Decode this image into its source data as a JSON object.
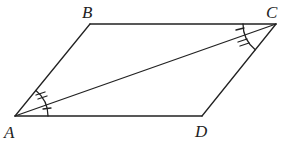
{
  "diagram": {
    "type": "parallelogram",
    "colors": {
      "stroke": "#222222",
      "background": "#ffffff"
    },
    "vertices": [
      {
        "name": "A",
        "x": 15,
        "y": 116
      },
      {
        "name": "B",
        "x": 90,
        "y": 24
      },
      {
        "name": "C",
        "x": 276,
        "y": 24
      },
      {
        "name": "D",
        "x": 202,
        "y": 116
      }
    ],
    "labels": {
      "A": "A",
      "B": "B",
      "C": "C",
      "D": "D"
    },
    "segments": [
      "AB",
      "BC",
      "CD",
      "DA",
      "AC"
    ],
    "angle_marks": [
      {
        "vertex": "A",
        "between": [
          "AB",
          "AC"
        ],
        "ticks": 2
      },
      {
        "vertex": "A",
        "between": [
          "AC",
          "AD"
        ],
        "ticks": 1
      },
      {
        "vertex": "C",
        "between": [
          "CB",
          "CA"
        ],
        "ticks": 1
      },
      {
        "vertex": "C",
        "between": [
          "CA",
          "CD"
        ],
        "ticks": 2
      }
    ]
  }
}
